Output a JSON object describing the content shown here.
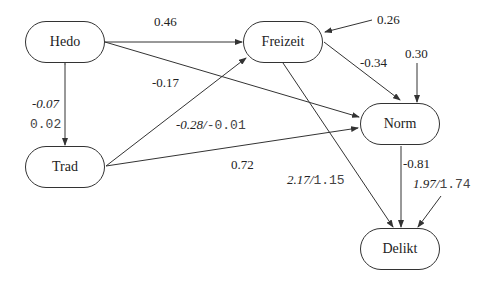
{
  "nodes": {
    "hedo": "Hedo",
    "freizeit": "Freizeit",
    "norm": "Norm",
    "trad": "Trad",
    "delikt": "Delikt"
  },
  "labels": {
    "hedo_freizeit": "0.46",
    "freizeit_error": "0.26",
    "norm_error": "0.30",
    "freizeit_norm": "-0.34",
    "hedo_norm": "-0.17",
    "hedo_trad_italic": "-0.07",
    "hedo_trad_mono": "0.02",
    "trad_freizeit_italic": "-0.28/",
    "trad_freizeit_mono": "-0.01",
    "trad_norm": "0.72",
    "norm_delikt": "-0.81",
    "freizeit_delikt_italic": "2.17/",
    "freizeit_delikt_mono": "1.15",
    "delikt_error_italic": "1.97/",
    "delikt_error_mono": "1.74"
  }
}
